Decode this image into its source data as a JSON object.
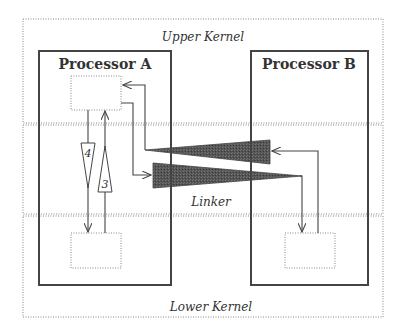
{
  "regions": {
    "upper": {
      "label": "Upper Kernel"
    },
    "linker": {
      "label": "Linker"
    },
    "lower": {
      "label": "Lower Kernel"
    }
  },
  "processors": {
    "a": {
      "label": "Processor A"
    },
    "b": {
      "label": "Processor B"
    }
  },
  "flows": {
    "f1": {
      "label": "1"
    },
    "f2": {
      "label": "2"
    },
    "f3": {
      "label": "3"
    },
    "f4": {
      "label": "4"
    }
  },
  "colors": {
    "line": "#444444",
    "dotted": "#888888",
    "wedge_fill": "#555555"
  }
}
